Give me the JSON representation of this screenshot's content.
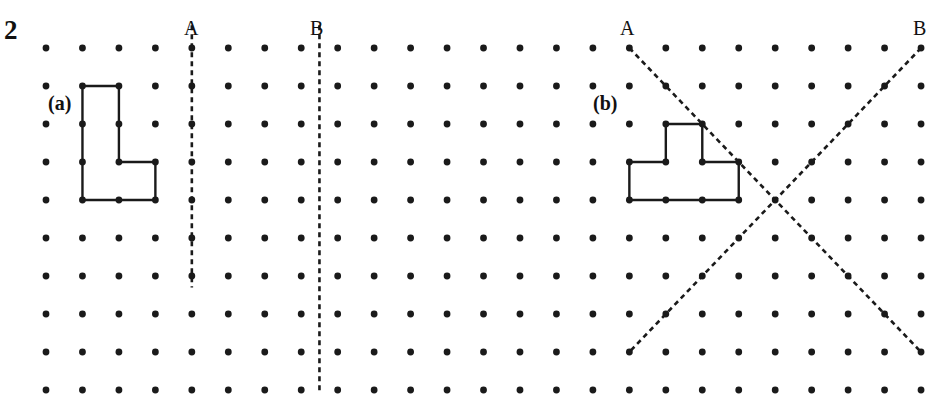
{
  "question": {
    "number": "2",
    "parts": [
      {
        "id": "a",
        "label": "(a)"
      },
      {
        "id": "b",
        "label": "(b)"
      }
    ]
  },
  "grid": {
    "columns": 25,
    "rows": 10,
    "origin_x": 46,
    "origin_y": 48,
    "spacing_x": 36.46,
    "spacing_y": 38.0,
    "dot_radius": 3.4,
    "dot_color": "#1a1a1a"
  },
  "mirror_lines": {
    "part_a": [
      {
        "label": "A",
        "type": "vertical",
        "from": [
          4,
          -0.6
        ],
        "to": [
          4,
          6.3
        ]
      },
      {
        "label": "B",
        "type": "vertical",
        "from": [
          7.5,
          -0.6
        ],
        "to": [
          7.5,
          9.05
        ]
      }
    ],
    "part_b": [
      {
        "label": "A",
        "type": "diagonal",
        "from": [
          16,
          0
        ],
        "to": [
          24,
          8
        ]
      },
      {
        "label": "B",
        "type": "diagonal",
        "from": [
          24,
          0
        ],
        "to": [
          16,
          8
        ]
      }
    ]
  },
  "shapes": {
    "part_a_L": [
      [
        1,
        1
      ],
      [
        2,
        1
      ],
      [
        2,
        3
      ],
      [
        3,
        3
      ],
      [
        3,
        4
      ],
      [
        1,
        4
      ]
    ],
    "part_b_T": [
      [
        17,
        2
      ],
      [
        18,
        2
      ],
      [
        18,
        3
      ],
      [
        19,
        3
      ],
      [
        19,
        4
      ],
      [
        16,
        4
      ],
      [
        16,
        3
      ],
      [
        17,
        3
      ]
    ]
  },
  "labels": {
    "part_a_A": "A",
    "part_a_B": "B",
    "part_b_A": "A",
    "part_b_B": "B"
  },
  "colors": {
    "ink": "#1a1a1a",
    "background": "#ffffff"
  }
}
